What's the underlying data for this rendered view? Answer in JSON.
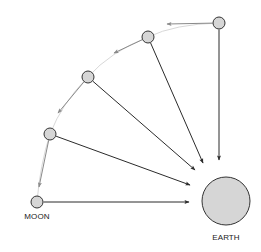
{
  "diagram": {
    "type": "orbital-motion",
    "colors": {
      "body_fill": "#d6d6d6",
      "body_stroke": "#333333",
      "gravity_arrow": "#2b2b2b",
      "velocity_arrow": "#8a8a8a",
      "orbit_path": "#d0d0d0",
      "background": "#ffffff"
    },
    "earth": {
      "label": "EARTH",
      "cx": 226,
      "cy": 201,
      "r": 24
    },
    "moons": [
      {
        "id": "moon-1",
        "cx": 219,
        "cy": 23,
        "r": 6,
        "velocity_to": [
          167,
          24
        ],
        "gravity_to": [
          219,
          160
        ],
        "label": ""
      },
      {
        "id": "moon-2",
        "cx": 148,
        "cy": 37,
        "r": 6,
        "velocity_to": [
          114,
          53
        ],
        "gravity_to": [
          203,
          163
        ],
        "label": ""
      },
      {
        "id": "moon-3",
        "cx": 88,
        "cy": 77,
        "r": 6,
        "velocity_to": [
          58,
          113
        ],
        "gravity_to": [
          195,
          170
        ],
        "label": ""
      },
      {
        "id": "moon-4",
        "cx": 50,
        "cy": 134,
        "r": 6,
        "velocity_to": [
          39,
          187
        ],
        "gravity_to": [
          190,
          185
        ],
        "label": ""
      },
      {
        "id": "moon-5",
        "cx": 37,
        "cy": 202,
        "r": 6,
        "velocity_to": null,
        "gravity_to": [
          189,
          202
        ],
        "label": "MOON"
      }
    ],
    "labels": {
      "moon": "MOON",
      "earth": "EARTH"
    }
  }
}
